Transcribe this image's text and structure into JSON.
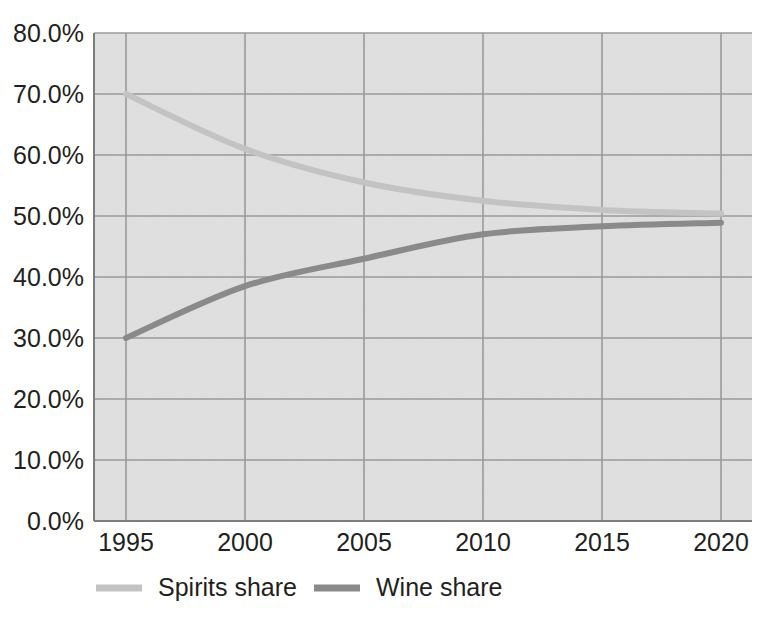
{
  "chart_data": {
    "type": "line",
    "title": "",
    "subtitle": "",
    "xlabel": "",
    "ylabel": "",
    "x": [
      1995,
      2000,
      2005,
      2010,
      2015,
      2020
    ],
    "categories": [
      "1995",
      "2000",
      "2005",
      "2010",
      "2015",
      "2020"
    ],
    "xlim": [
      1994,
      2021
    ],
    "ylim": [
      0,
      80
    ],
    "y_tick_values": [
      0,
      10,
      20,
      30,
      40,
      50,
      60,
      70,
      80
    ],
    "y_tick_labels": [
      "0.0%",
      "10.0%",
      "20.0%",
      "30.0%",
      "40.0%",
      "50.0%",
      "60.0%",
      "70.0%",
      "80.0%"
    ],
    "x_tick_labels": [
      "1995",
      "2000",
      "2005",
      "2010",
      "2015",
      "2020"
    ],
    "grid": true,
    "grid_axes": "both",
    "legend_position": "bottom",
    "series": [
      {
        "name": "Spirits share",
        "color": "#c3c3c3",
        "values": [
          70.0,
          61.0,
          55.5,
          52.5,
          51.0,
          50.4
        ],
        "unit": "%"
      },
      {
        "name": "Wine share",
        "color": "#8a8a8a",
        "values": [
          30.0,
          38.5,
          43.0,
          47.0,
          48.3,
          48.9
        ],
        "unit": "%"
      }
    ],
    "annotations": []
  },
  "legend": {
    "items": [
      {
        "label": "Spirits share",
        "color": "#c3c3c3"
      },
      {
        "label": "Wine share",
        "color": "#8a8a8a"
      }
    ]
  },
  "axes": {
    "y_labels": [
      "80.0%",
      "70.0%",
      "60.0%",
      "50.0%",
      "40.0%",
      "30.0%",
      "20.0%",
      "10.0%",
      "0.0%"
    ],
    "x_labels": [
      "1995",
      "2000",
      "2005",
      "2010",
      "2015",
      "2020"
    ]
  },
  "colors": {
    "plot_background": "#e3e3e3",
    "gridline": "#9a9a9a",
    "axis": "#7d7d7d",
    "text": "#231f20",
    "series_spirits": "#c3c3c3",
    "series_wine": "#8a8a8a",
    "page_background": "#ffffff"
  }
}
